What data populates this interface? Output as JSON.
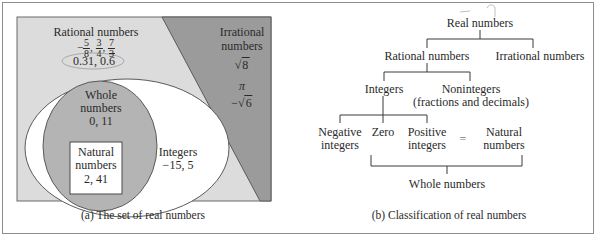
{
  "panel_a": {
    "caption": "(a) The set of real numbers",
    "colors": {
      "rational_region": "#dcdcdc",
      "irrational_region": "#9b9b9b",
      "integers_ellipse": "#ffffff",
      "whole_circle": "#b4b4b4",
      "natural_box": "#ffffff",
      "border": "#5a5a5a"
    },
    "rational": {
      "title": "Rational numbers",
      "fractions": [
        {
          "sign": "−",
          "num": "5",
          "den": "8"
        },
        {
          "sign": "",
          "num": "3",
          "den": "4"
        },
        {
          "sign": "",
          "num": "7",
          "den": "3"
        }
      ],
      "decimal_1": "0.31",
      "decimal_sep": ", ",
      "decimal_2_int": "0.",
      "decimal_2_repeat": "6"
    },
    "irrational": {
      "title_line1": "Irrational",
      "title_line2": "numbers",
      "example_1_radicand": "8",
      "example_2": "π",
      "example_3_sign": "−",
      "example_3_radicand": "6"
    },
    "integers": {
      "title": "Integers",
      "examples": "−15, 5"
    },
    "whole": {
      "title_line1": "Whole",
      "title_line2": "numbers",
      "examples": "0, 11"
    },
    "natural": {
      "title_line1": "Natural",
      "title_line2": "numbers",
      "examples": "2, 41"
    }
  },
  "panel_b": {
    "caption": "(b) Classification of real numbers",
    "nodes": {
      "real": "Real numbers",
      "rational": "Rational numbers",
      "irrational": "Irrational numbers",
      "integers": "Integers",
      "nonintegers_line1": "Nonintegers",
      "nonintegers_line2": "(fractions and decimals)",
      "negative_line1": "Negative",
      "negative_line2": "integers",
      "zero": "Zero",
      "positive_line1": "Positive",
      "positive_line2": "integers",
      "equals": "=",
      "natural_line1": "Natural",
      "natural_line2": "numbers",
      "whole": "Whole numbers"
    }
  }
}
